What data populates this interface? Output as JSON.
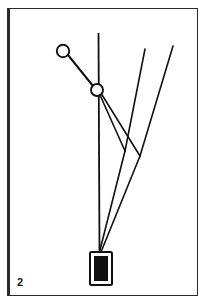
{
  "figure": {
    "label": "2",
    "type": "technical-line-drawing",
    "caption_number": "2",
    "frame": {
      "stroke_color": "#2b2b2b",
      "left_edge_width": 3,
      "other_edge_width": 1,
      "x": 7,
      "y": 8,
      "width": 191,
      "height": 288
    },
    "ink_color": "#111111",
    "background_color": "#ffffff",
    "elements": {
      "vertical_line": {
        "name": "plumb-line",
        "x1": 98,
        "y1": 33,
        "x2": 99,
        "y2": 252,
        "stroke_width": 1.7
      },
      "upper_circle": {
        "name": "upper-pivot",
        "cx": 63,
        "cy": 51,
        "r": 6.2,
        "stroke_width": 1.8,
        "fill": "#ffffff"
      },
      "lower_circle": {
        "name": "lower-pivot",
        "cx": 97,
        "cy": 90,
        "r": 6.0,
        "stroke_width": 1.8,
        "fill": "#ffffff"
      },
      "connector_arm": {
        "name": "upper-arm",
        "x1": 68,
        "y1": 55,
        "x2": 93,
        "y2": 86,
        "stroke_width": 1.9
      },
      "fan_line_a": {
        "name": "fan-line-inner",
        "x1": 100,
        "y1": 95,
        "x2": 133,
        "y2": 158,
        "stroke_width": 1.6
      },
      "fan_line_b": {
        "name": "fan-line-outer",
        "x1": 101,
        "y1": 94,
        "x2": 140,
        "y2": 158,
        "stroke_width": 1.6
      },
      "diagonal_upper_left": {
        "name": "diagonal-rod-left",
        "x1": 145,
        "y1": 49,
        "x2": 124,
        "y2": 152,
        "stroke_width": 1.6
      },
      "diagonal_upper_right": {
        "name": "diagonal-rod-right",
        "x1": 173,
        "y1": 46,
        "x2": 139,
        "y2": 154,
        "stroke_width": 1.6
      },
      "converge_line_left": {
        "name": "converging-line-left",
        "x1": 124,
        "y1": 152,
        "x2": 99,
        "y2": 252,
        "stroke_width": 1.6
      },
      "converge_line_right": {
        "name": "converging-line-right",
        "x1": 139,
        "y1": 154,
        "x2": 101,
        "y2": 252,
        "stroke_width": 1.6
      },
      "weight_outer": {
        "name": "weight-outline",
        "x": 90,
        "y": 252,
        "width": 22,
        "height": 33,
        "stroke_width": 2.0,
        "fill": "#ffffff"
      },
      "weight_inner": {
        "name": "weight-body",
        "x": 94,
        "y": 256,
        "width": 14,
        "height": 25,
        "fill": "#111111"
      }
    }
  }
}
